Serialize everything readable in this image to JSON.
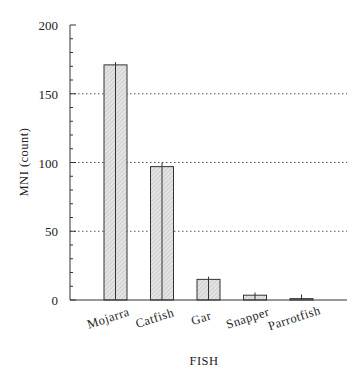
{
  "chart_data": {
    "type": "bar",
    "title": "",
    "xlabel": "FISH",
    "ylabel": "MNI (count)",
    "categories": [
      "Mojarra",
      "Catfish",
      "Gar",
      "Snapper",
      "Parrotfish"
    ],
    "values": [
      171,
      97,
      15,
      3.5,
      1
    ],
    "error_bars": [
      2,
      3,
      2,
      2,
      3
    ],
    "ylim": [
      0,
      200
    ],
    "yticks": [
      0,
      50,
      100,
      150,
      200
    ],
    "minor_tick_step": 10,
    "grid": {
      "on": true,
      "axis": "y",
      "style": "dotted",
      "at": [
        50,
        100,
        150
      ]
    },
    "legend": null,
    "bar_fill": "hatched-light-gray",
    "colors": {
      "bar_fill": "#d9d9d9",
      "bar_stroke": "#333333",
      "axis": "#333333",
      "grid": "#555555"
    }
  }
}
